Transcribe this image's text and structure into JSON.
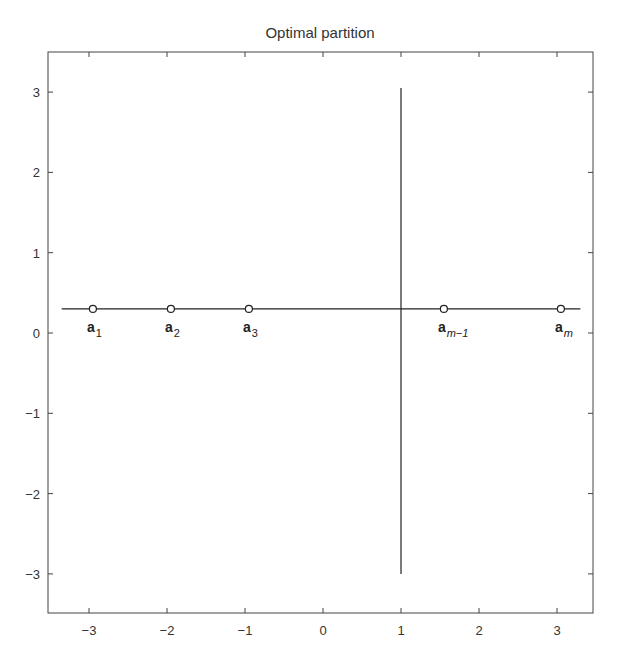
{
  "chart_data": {
    "type": "scatter",
    "title": "Optimal partition",
    "xlabel": "",
    "ylabel": "",
    "xlim": [
      -3.4,
      3.4
    ],
    "ylim": [
      -3.5,
      3.5
    ],
    "xticks": [
      -3,
      -2,
      -1,
      0,
      1,
      2,
      3
    ],
    "yticks": [
      -3,
      -2,
      -1,
      0,
      1,
      2,
      3
    ],
    "xtick_labels": [
      "−3",
      "−2",
      "−1",
      "0",
      "1",
      "2",
      "3"
    ],
    "ytick_labels": [
      "−3",
      "−2",
      "−1",
      "0",
      "1",
      "2",
      "3"
    ],
    "grid": false,
    "legend": null,
    "points": [
      {
        "x": -2.95,
        "y": 0.3,
        "label": "a",
        "sub": "1",
        "sub_italic": false
      },
      {
        "x": -1.95,
        "y": 0.3,
        "label": "a",
        "sub": "2",
        "sub_italic": false
      },
      {
        "x": -0.95,
        "y": 0.3,
        "label": "a",
        "sub": "3",
        "sub_italic": false
      },
      {
        "x": 1.55,
        "y": 0.3,
        "label": "a",
        "sub": "m−1",
        "sub_italic": true
      },
      {
        "x": 3.05,
        "y": 0.3,
        "label": "a",
        "sub": "m",
        "sub_italic": true
      }
    ],
    "lines": [
      {
        "name": "horizontal-line",
        "x": [
          -3.35,
          3.3
        ],
        "y": [
          0.3,
          0.3
        ]
      },
      {
        "name": "vertical-partition-line",
        "x": [
          1,
          1
        ],
        "y": [
          -3.0,
          3.05
        ]
      }
    ],
    "marker": "open-circle"
  },
  "colors": {
    "axis": "#444444",
    "line": "#222222",
    "text": "#333333",
    "background": "#ffffff"
  }
}
